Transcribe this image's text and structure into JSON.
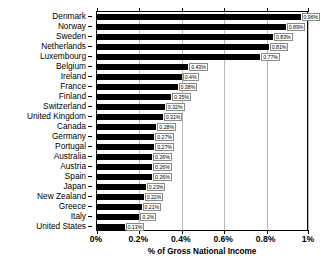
{
  "chart_data": {
    "type": "bar",
    "orientation": "horizontal",
    "title": "",
    "xlabel": "% of Gross National Income",
    "ylabel": "",
    "xlim": [
      0,
      1.0
    ],
    "xticks": [
      0,
      0.2,
      0.4,
      0.6,
      0.8,
      1.0
    ],
    "xticklabels": [
      "0%",
      "0.2%",
      "0.4%",
      "0.6%",
      "0.8%",
      "1%"
    ],
    "grid": true,
    "legend": false,
    "bar_color": "#000000",
    "categories": [
      "Denmark",
      "Norway",
      "Sweden",
      "Netherlands",
      "Luxembourg",
      "Belgium",
      "Ireland",
      "France",
      "Finland",
      "Switzerland",
      "United Kingdom",
      "Canada",
      "Germany",
      "Portugal",
      "Australia",
      "Austria",
      "Spain",
      "Japan",
      "New Zealand",
      "Greece",
      "Italy",
      "United States"
    ],
    "values": [
      0.96,
      0.89,
      0.83,
      0.81,
      0.77,
      0.43,
      0.4,
      0.38,
      0.35,
      0.32,
      0.31,
      0.28,
      0.27,
      0.27,
      0.26,
      0.26,
      0.26,
      0.23,
      0.22,
      0.21,
      0.2,
      0.13
    ],
    "data_labels": [
      "0.96%",
      "0.89%",
      "0.83%",
      "0.81%",
      "0.77%",
      "0.43%",
      "0.4%",
      "0.38%",
      "0.35%",
      "0.32%",
      "0.31%",
      "0.28%",
      "0.27%",
      "0.27%",
      "0.26%",
      "0.26%",
      "0.26%",
      "0.23%",
      "0.22%",
      "0.21%",
      "0.2%",
      "0.13%"
    ]
  }
}
